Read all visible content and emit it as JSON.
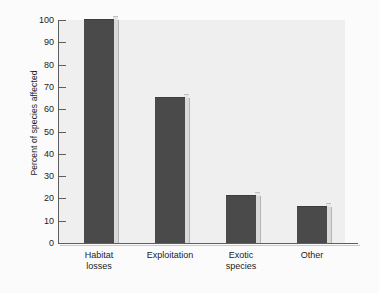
{
  "chart_data": {
    "type": "bar",
    "title": "",
    "subtitle": "",
    "xlabel": "",
    "ylabel": "Percent of species affected",
    "categories": [
      "Habitat losses",
      "Exploitation",
      "Exotic species",
      "Other"
    ],
    "values": [
      100,
      65,
      21,
      16
    ],
    "ylim": [
      0,
      100
    ],
    "yticks": [
      0,
      10,
      20,
      30,
      40,
      50,
      60,
      70,
      80,
      90,
      100
    ],
    "ytick_labels": [
      "0",
      "10",
      "20",
      "30",
      "40",
      "50",
      "60",
      "70",
      "80",
      "90",
      "100"
    ],
    "grid": false,
    "legend": null,
    "legend_position": "none",
    "annotations": [],
    "style": {
      "bar_color": "#4a4a4a",
      "bar_edge_color": "#3d3d3d",
      "bar_side_color": "#d9d9d9",
      "plot_background": "#efefef",
      "figure_background": "#fbfbfb",
      "axis_color": "#5d5d5d",
      "text_color": "#1c1c1c"
    }
  },
  "axis": {
    "y_title": "Percent of species affected"
  },
  "categories": [
    {
      "line1": "Habitat",
      "line2": "losses",
      "value": 100
    },
    {
      "line1": "Exploitation",
      "line2": "",
      "value": 65
    },
    {
      "line1": "Exotic",
      "line2": "species",
      "value": 21
    },
    {
      "line1": "Other",
      "line2": "",
      "value": 16
    }
  ],
  "yticks": [
    {
      "label": "100",
      "value": 100
    },
    {
      "label": "90",
      "value": 90
    },
    {
      "label": "80",
      "value": 80
    },
    {
      "label": "70",
      "value": 70
    },
    {
      "label": "60",
      "value": 60
    },
    {
      "label": "50",
      "value": 50
    },
    {
      "label": "40",
      "value": 40
    },
    {
      "label": "30",
      "value": 30
    },
    {
      "label": "20",
      "value": 20
    },
    {
      "label": "10",
      "value": 10
    },
    {
      "label": "0",
      "value": 0
    }
  ]
}
